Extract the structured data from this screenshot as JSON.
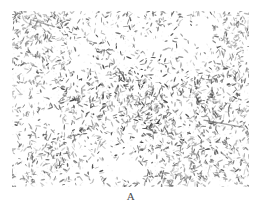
{
  "figure": {
    "panel_label": "A",
    "caption_position": "below",
    "background_color": "#ffffff"
  },
  "micrograph": {
    "kind": "light-microscopy-stained-smear",
    "subject": "rod-shaped bacilli",
    "field_background_color": "#ffffff",
    "particle_color_dark": "#3a3a3a",
    "particle_color_mid": "#6e6e6e",
    "particle_color_light": "#a8a8a8",
    "frame": {
      "x": 12,
      "y": 11,
      "width": 237,
      "height": 176
    },
    "density_description": "dense randomly-oriented short rods with sparse white voids",
    "particle_count": 2600,
    "rod_length_px": [
      2,
      6
    ],
    "rod_width_px": [
      0.8,
      1.6
    ],
    "density_field": {
      "note": "relative particle density by grid cell, 0 = empty void, 1 = densest",
      "cols": 8,
      "rows": 6,
      "values": [
        [
          0.95,
          0.9,
          0.7,
          0.55,
          0.6,
          0.45,
          0.2,
          0.55
        ],
        [
          0.9,
          0.85,
          0.4,
          0.35,
          0.55,
          0.3,
          0.25,
          0.7
        ],
        [
          0.7,
          0.75,
          0.8,
          0.85,
          0.8,
          0.7,
          0.55,
          0.75
        ],
        [
          0.45,
          0.35,
          0.7,
          0.9,
          1.0,
          0.85,
          0.7,
          0.8
        ],
        [
          0.55,
          0.6,
          0.75,
          0.65,
          0.55,
          0.65,
          0.75,
          0.7
        ],
        [
          0.8,
          0.75,
          0.45,
          0.3,
          0.6,
          0.7,
          0.8,
          0.75
        ]
      ]
    },
    "voids": [
      {
        "cx": 0.8,
        "cy": 0.13,
        "rx": 0.12,
        "ry": 0.11
      },
      {
        "cx": 0.17,
        "cy": 0.63,
        "rx": 0.1,
        "ry": 0.09
      },
      {
        "cx": 0.46,
        "cy": 0.89,
        "rx": 0.13,
        "ry": 0.08
      },
      {
        "cx": 0.28,
        "cy": 0.3,
        "rx": 0.07,
        "ry": 0.07
      },
      {
        "cx": 0.6,
        "cy": 0.2,
        "rx": 0.07,
        "ry": 0.06
      }
    ],
    "clusters": [
      {
        "cx": 0.6,
        "cy": 0.6,
        "r": 0.12,
        "strength": 1.0
      },
      {
        "cx": 0.12,
        "cy": 0.12,
        "r": 0.16,
        "strength": 0.9
      },
      {
        "cx": 0.9,
        "cy": 0.9,
        "r": 0.12,
        "strength": 0.8
      }
    ],
    "streaks": [
      {
        "x1": 0.81,
        "y1": 0.62,
        "x2": 0.97,
        "y2": 0.66,
        "weight": 1.4
      },
      {
        "x1": 0.08,
        "y1": 0.05,
        "x2": 0.18,
        "y2": 0.09,
        "weight": 1.1
      }
    ]
  }
}
